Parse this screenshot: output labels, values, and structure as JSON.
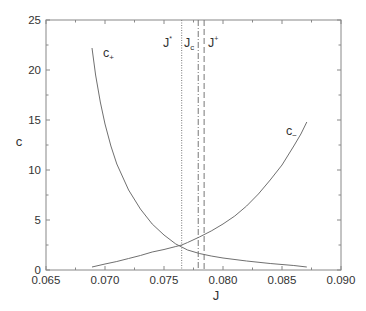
{
  "chart_data": {
    "type": "line",
    "title": "",
    "xlabel": "J",
    "ylabel": "c",
    "xlim": [
      0.065,
      0.09
    ],
    "ylim": [
      0,
      25
    ],
    "xticks": [
      "0.065",
      "0.070",
      "0.075",
      "0.080",
      "0.085",
      "0.090"
    ],
    "yticks": [
      "0",
      "5",
      "10",
      "15",
      "20",
      "25"
    ],
    "grid": false,
    "series": [
      {
        "name": "c+",
        "label_main": "c",
        "label_sub": "+",
        "x": [
          0.0689,
          0.0692,
          0.0696,
          0.07,
          0.0705,
          0.071,
          0.072,
          0.073,
          0.074,
          0.075,
          0.076,
          0.0765,
          0.077,
          0.078,
          0.079,
          0.08,
          0.082,
          0.084,
          0.086,
          0.0871
        ],
        "y": [
          22.2,
          19.5,
          16.8,
          14.6,
          12.4,
          10.6,
          8.0,
          6.1,
          4.6,
          3.5,
          2.6,
          2.3,
          2.0,
          1.65,
          1.4,
          1.2,
          0.9,
          0.65,
          0.45,
          0.3
        ]
      },
      {
        "name": "c-",
        "label_main": "c",
        "label_sub": "−",
        "x": [
          0.0689,
          0.07,
          0.071,
          0.072,
          0.073,
          0.074,
          0.075,
          0.076,
          0.0765,
          0.077,
          0.078,
          0.079,
          0.08,
          0.081,
          0.082,
          0.083,
          0.084,
          0.085,
          0.086,
          0.0866,
          0.0871
        ],
        "y": [
          0.3,
          0.6,
          0.85,
          1.15,
          1.45,
          1.8,
          2.05,
          2.35,
          2.5,
          2.75,
          3.3,
          3.9,
          4.6,
          5.4,
          6.4,
          7.6,
          9.0,
          10.5,
          12.4,
          13.6,
          14.8
        ]
      }
    ],
    "vlines": [
      {
        "name": "J*",
        "label_main": "J",
        "label_sup": "*",
        "x": 0.0765,
        "style": "dotted"
      },
      {
        "name": "Jc",
        "label_main": "J",
        "label_sub": "c",
        "x": 0.0779,
        "style": "dashdot"
      },
      {
        "name": "J+",
        "label_main": "J",
        "label_sup": "+",
        "x": 0.0784,
        "style": "dashed"
      }
    ]
  },
  "colors": {
    "axis": "#888888",
    "curve": "#707070",
    "text": "#333333"
  }
}
